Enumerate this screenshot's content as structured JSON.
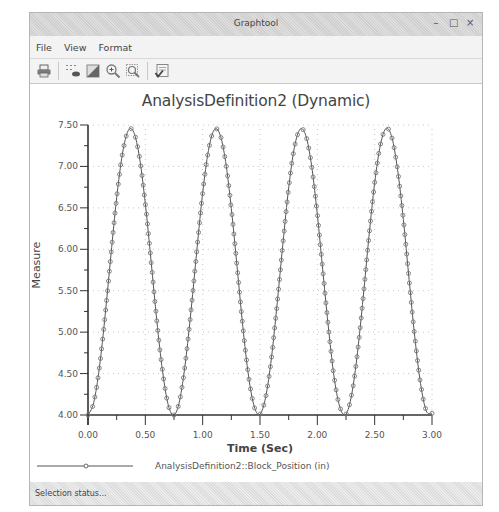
{
  "window": {
    "title": "Graphtool",
    "controls": {
      "minimize": "–",
      "maximize": "□",
      "close": "×"
    }
  },
  "menu": {
    "items": [
      {
        "label": "File"
      },
      {
        "label": "View"
      },
      {
        "label": "Format"
      }
    ]
  },
  "toolbar": {
    "buttons": [
      {
        "icon": "print-icon"
      },
      {
        "icon": "show-points-icon"
      },
      {
        "icon": "fill-icon"
      },
      {
        "icon": "zoom-in-icon"
      },
      {
        "icon": "zoom-fit-icon"
      },
      {
        "icon": "apply-checklist-icon"
      }
    ]
  },
  "status": {
    "text": "Selection status..."
  },
  "colors": {
    "series": "#555555",
    "marker": "#777777",
    "grid": "#c8c8c8",
    "axis": "#333333"
  },
  "chart_data": {
    "type": "line",
    "title": "AnalysisDefinition2 (Dynamic)",
    "xlabel": "Time (Sec)",
    "ylabel": "Measure",
    "xlim": [
      0,
      3.0
    ],
    "ylim": [
      4.0,
      7.5
    ],
    "xticks": [
      "0.00",
      "0.50",
      "1.00",
      "1.50",
      "2.00",
      "2.50",
      "3.00"
    ],
    "yticks": [
      "4.00",
      "4.50",
      "5.00",
      "5.50",
      "6.00",
      "6.50",
      "7.00",
      "7.50"
    ],
    "grid": true,
    "legend_position": "bottom",
    "series": [
      {
        "name": "AnalysisDefinition2::Block_Position (in)",
        "marker": "circle",
        "x": [
          0.0,
          0.05,
          0.1,
          0.15,
          0.2,
          0.25,
          0.3,
          0.35,
          0.4,
          0.45,
          0.5,
          0.55,
          0.6,
          0.65,
          0.7,
          0.75,
          0.8,
          0.85,
          0.9,
          0.95,
          1.0,
          1.05,
          1.1,
          1.15,
          1.2,
          1.25,
          1.3,
          1.35,
          1.4,
          1.45,
          1.5,
          1.55,
          1.6,
          1.65,
          1.7,
          1.75,
          1.8,
          1.85,
          1.9,
          1.95,
          2.0,
          2.05,
          2.1,
          2.15,
          2.2,
          2.25,
          2.3,
          2.35,
          2.4,
          2.45,
          2.5,
          2.55,
          2.6,
          2.65,
          2.7,
          2.75,
          2.8,
          2.85,
          2.9,
          2.95,
          3.0
        ],
        "values": [
          4.0,
          4.15,
          4.58,
          5.21,
          5.93,
          6.62,
          7.15,
          7.43,
          7.41,
          7.1,
          6.55,
          5.86,
          5.14,
          4.53,
          4.12,
          4.0,
          4.18,
          4.64,
          5.28,
          6.0,
          6.68,
          7.19,
          7.44,
          7.39,
          7.06,
          6.49,
          5.79,
          5.07,
          4.47,
          4.1,
          4.01,
          4.22,
          4.69,
          5.35,
          6.07,
          6.74,
          7.23,
          7.45,
          7.37,
          7.01,
          6.42,
          5.71,
          5.01,
          4.42,
          4.08,
          4.01,
          4.25,
          4.75,
          5.42,
          6.15,
          6.8,
          7.26,
          7.46,
          7.35,
          6.96,
          6.36,
          5.64,
          4.94,
          4.38,
          4.05,
          4.02
        ]
      }
    ]
  }
}
